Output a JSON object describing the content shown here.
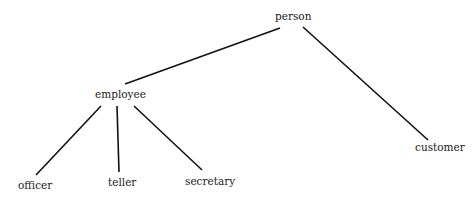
{
  "diagram": {
    "type": "tree",
    "nodes": [
      {
        "id": "person",
        "label": "person",
        "x": 275,
        "y": 11
      },
      {
        "id": "employee",
        "label": "employee",
        "x": 95,
        "y": 89
      },
      {
        "id": "customer",
        "label": "customer",
        "x": 415,
        "y": 142
      },
      {
        "id": "officer",
        "label": "officer",
        "x": 18,
        "y": 180
      },
      {
        "id": "teller",
        "label": "teller",
        "x": 108,
        "y": 177
      },
      {
        "id": "secretary",
        "label": "secretary",
        "x": 185,
        "y": 176
      }
    ],
    "edges": [
      {
        "from": "person",
        "to": "employee",
        "x1": 280,
        "y1": 28,
        "x2": 125,
        "y2": 84
      },
      {
        "from": "person",
        "to": "customer",
        "x1": 303,
        "y1": 27,
        "x2": 428,
        "y2": 140
      },
      {
        "from": "employee",
        "to": "officer",
        "x1": 101,
        "y1": 106,
        "x2": 36,
        "y2": 175
      },
      {
        "from": "employee",
        "to": "teller",
        "x1": 117,
        "y1": 106,
        "x2": 119,
        "y2": 172
      },
      {
        "from": "employee",
        "to": "secretary",
        "x1": 134,
        "y1": 106,
        "x2": 202,
        "y2": 170
      }
    ],
    "colors": {
      "line": "#111111",
      "text": "#1a1a1a",
      "background": "#ffffff"
    }
  }
}
